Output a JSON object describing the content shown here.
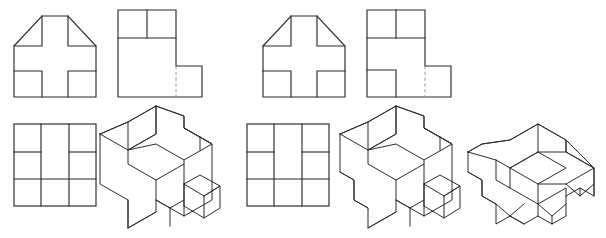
{
  "document": {
    "type": "engineering-drawing",
    "title": "Orthographic and Isometric Projection Exercise",
    "background_color": "#ffffff",
    "visible_line_color": "#2b2b2b",
    "hidden_line_color": "#9a9a9a",
    "units": "px",
    "canvas": {
      "width": 606,
      "height": 238
    }
  },
  "groups": [
    {
      "id": "group-left",
      "label": "Problem Set 1",
      "views": [
        {
          "id": "view-front-left",
          "name": "front-view",
          "projection": "orthographic",
          "label": "Front View",
          "description": "Square outline with upper corners chamfered and a plus-shaped cutout relief",
          "origin": {
            "x": 14,
            "y": 10
          },
          "size": {
            "width": 82,
            "height": 87
          },
          "features": [
            "chamfer-left",
            "chamfer-right",
            "plus-cutout"
          ],
          "hidden_lines": 0
        },
        {
          "id": "view-side-left",
          "name": "side-view",
          "projection": "orthographic",
          "label": "Side View",
          "description": "L-shaped profile with two cells at top and a hidden line on the lower right step",
          "origin": {
            "x": 118,
            "y": 10
          },
          "size": {
            "width": 84,
            "height": 87
          },
          "features": [
            "step-lower-right",
            "two-top-cells"
          ],
          "hidden_lines": 1
        },
        {
          "id": "view-top-left",
          "name": "top-view",
          "projection": "orthographic",
          "label": "Top View",
          "description": "Square divided by two vertical lines into three columns with horizontal divisions in the outer columns",
          "origin": {
            "x": 14,
            "y": 124
          },
          "size": {
            "width": 82,
            "height": 82
          },
          "features": [
            "three-columns",
            "outer-column-divisions"
          ],
          "hidden_lines": 0
        },
        {
          "id": "view-iso-left",
          "name": "isometric-view",
          "projection": "isometric",
          "label": "Isometric View",
          "description": "Pictorial of the block with chamfered top-left face, notched plus recess and a projecting small cube at the right",
          "origin": {
            "x": 100,
            "y": 106
          },
          "size": {
            "width": 120,
            "height": 122
          },
          "features": [
            "chamfered-face",
            "plus-recess",
            "projecting-cube"
          ],
          "hidden_lines": 0
        }
      ]
    },
    {
      "id": "group-right",
      "label": "Problem Set 2",
      "views": [
        {
          "id": "view-front-right",
          "name": "front-view",
          "projection": "orthographic",
          "label": "Front View",
          "description": "Square outline with upper corners chamfered and a plus-shaped cutout relief",
          "origin": {
            "x": 263,
            "y": 10
          },
          "size": {
            "width": 82,
            "height": 87
          },
          "features": [
            "chamfer-left",
            "chamfer-right",
            "plus-cutout"
          ],
          "hidden_lines": 0
        },
        {
          "id": "view-side-right",
          "name": "side-view",
          "projection": "orthographic",
          "label": "Side View",
          "description": "L-shaped profile with two cells at top, a lower-left cell and a hidden line on the lower right step",
          "origin": {
            "x": 367,
            "y": 10
          },
          "size": {
            "width": 84,
            "height": 87
          },
          "features": [
            "step-lower-right",
            "two-top-cells",
            "lower-left-cell"
          ],
          "hidden_lines": 1
        },
        {
          "id": "view-top-right",
          "name": "top-view",
          "projection": "orthographic",
          "label": "Top View",
          "description": "Square divided by two vertical lines into three columns with horizontal divisions in the outer columns",
          "origin": {
            "x": 247,
            "y": 124
          },
          "size": {
            "width": 82,
            "height": 82
          },
          "features": [
            "three-columns",
            "outer-column-divisions"
          ],
          "hidden_lines": 0
        },
        {
          "id": "view-iso-right-a",
          "name": "isometric-view-a",
          "projection": "isometric",
          "label": "Isometric View A",
          "description": "Pictorial with chamfered top-left face, plus recess, projecting cube and a stepped notch at the lower left",
          "origin": {
            "x": 340,
            "y": 106
          },
          "size": {
            "width": 120,
            "height": 122
          },
          "features": [
            "chamfered-face",
            "plus-recess",
            "projecting-cube",
            "lower-left-notch"
          ],
          "hidden_lines": 0
        },
        {
          "id": "view-iso-right-b",
          "name": "isometric-view-b",
          "projection": "isometric",
          "label": "Isometric View B",
          "description": "Low flat pictorial with an inclined ramp face across the top and V-notches along the front and right faces",
          "origin": {
            "x": 468,
            "y": 118
          },
          "size": {
            "width": 132,
            "height": 110
          },
          "features": [
            "inclined-ramp",
            "front-v-notches",
            "right-v-notch"
          ],
          "hidden_lines": 0
        }
      ]
    }
  ]
}
